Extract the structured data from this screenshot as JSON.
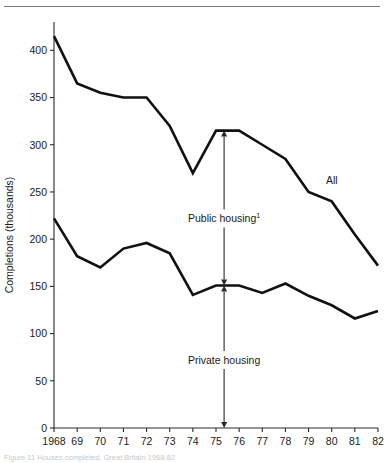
{
  "figure": {
    "rule_top": true,
    "caption": "Figure 11  Houses completed, Great Britain 1968-82"
  },
  "chart_data": {
    "type": "line",
    "title": "",
    "xlabel": "",
    "ylabel": "Completions (thousands)",
    "x": [
      1968,
      1969,
      1970,
      1971,
      1972,
      1973,
      1974,
      1975,
      1976,
      1977,
      1978,
      1979,
      1980,
      1981,
      1982
    ],
    "xtick_labels": [
      "1968",
      "69",
      "70",
      "71",
      "72",
      "73",
      "74",
      "75",
      "76",
      "77",
      "78",
      "79",
      "80",
      "81",
      "82"
    ],
    "ytick_labels": [
      "0",
      "50",
      "100",
      "150",
      "200",
      "250",
      "300",
      "350",
      "400"
    ],
    "yticks": [
      0,
      50,
      100,
      150,
      200,
      250,
      300,
      350,
      400
    ],
    "ylim": [
      0,
      430
    ],
    "xlim": [
      1968,
      1982
    ],
    "grid": false,
    "legend_position": "inline-annotations",
    "series": [
      {
        "name": "All",
        "label": "All",
        "label_x": 1980.0,
        "label_y": 258,
        "color": "#111111",
        "values": [
          415,
          365,
          355,
          350,
          350,
          320,
          270,
          315,
          315,
          300,
          285,
          250,
          240,
          205,
          172
        ]
      },
      {
        "name": "Private housing",
        "label": "Private housing",
        "color": "#111111",
        "values": [
          222,
          182,
          170,
          190,
          196,
          185,
          141,
          151,
          151,
          143,
          153,
          140,
          130,
          116,
          124
        ]
      }
    ],
    "annotations": [
      {
        "name": "public-housing",
        "text": "Public housing",
        "superscript": "1",
        "arrow_x": 1975.35,
        "arrow_top_value": 315,
        "arrow_bottom_value": 151,
        "text_value": 222
      },
      {
        "name": "private-housing",
        "text": "Private housing",
        "superscript": "",
        "arrow_x": 1975.35,
        "arrow_top_value": 151,
        "arrow_bottom_value": 0,
        "text_value": 72
      }
    ]
  }
}
